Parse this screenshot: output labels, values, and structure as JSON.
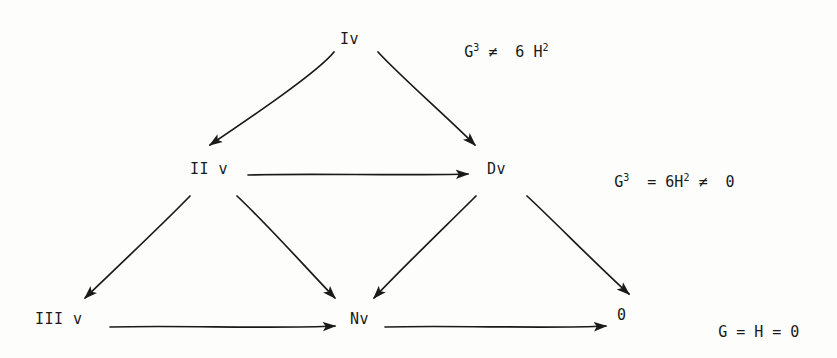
{
  "document": {
    "type": "scanned-mathematical-diagram",
    "background_color": "#fdfdfc",
    "ink_color": "#1a1a1a"
  },
  "nodes": [
    {
      "id": "node-top",
      "label": "Iv",
      "x": 340,
      "y": 32
    },
    {
      "id": "node-middle-left",
      "label": "II v",
      "x": 190,
      "y": 162
    },
    {
      "id": "node-middle-right",
      "label": "Dv",
      "x": 487,
      "y": 162
    },
    {
      "id": "node-bottom-left",
      "label": "III v",
      "x": 35,
      "y": 312
    },
    {
      "id": "node-bottom-mid",
      "label": "Nv",
      "x": 350,
      "y": 312
    },
    {
      "id": "node-bottom-right",
      "label": "0",
      "x": 617,
      "y": 308
    }
  ],
  "equations": [
    {
      "id": "equation-top",
      "x": 428,
      "y": 30,
      "parts": [
        {
          "text": "G",
          "sup": "3"
        },
        {
          "text": " ≠  6 "
        },
        {
          "text": "H",
          "sup": "2"
        }
      ],
      "plain": "G3 ≠ 6 H2"
    },
    {
      "id": "equation-middle",
      "x": 578,
      "y": 160,
      "parts": [
        {
          "text": "G",
          "sup": "3"
        },
        {
          "text": "  = 6"
        },
        {
          "text": "H",
          "sup": "2"
        },
        {
          "text": " ≠  0"
        }
      ],
      "plain": "G3 = 6H2 ≠ 0"
    },
    {
      "id": "equation-bottom",
      "x": 682,
      "y": 310,
      "parts": [
        {
          "text": "G = H = 0"
        }
      ],
      "plain": "G = H = 0"
    }
  ],
  "arrows": [
    {
      "id": "arrow-top-to-middle-left",
      "from": "node-top",
      "to": "node-middle-left",
      "direction": "down-left",
      "x1": 334,
      "y1": 52,
      "x2": 208,
      "y2": 147
    },
    {
      "id": "arrow-top-to-middle-right",
      "from": "node-top",
      "to": "node-middle-right",
      "direction": "down-right",
      "x1": 378,
      "y1": 52,
      "x2": 477,
      "y2": 147
    },
    {
      "id": "arrow-middle-left-to-right",
      "from": "node-middle-left",
      "to": "node-middle-right",
      "direction": "right",
      "x1": 248,
      "y1": 174,
      "x2": 470,
      "y2": 174
    },
    {
      "id": "arrow-middle-left-to-bottom-left",
      "from": "node-middle-left",
      "to": "node-bottom-left",
      "direction": "down-left",
      "x1": 190,
      "y1": 196,
      "x2": 83,
      "y2": 300
    },
    {
      "id": "arrow-middle-left-to-bottom-mid",
      "from": "node-middle-left",
      "to": "node-bottom-mid",
      "direction": "down-right",
      "x1": 237,
      "y1": 196,
      "x2": 333,
      "y2": 300
    },
    {
      "id": "arrow-middle-right-to-bottom-mid",
      "from": "node-middle-right",
      "to": "node-bottom-mid",
      "direction": "down-left",
      "x1": 476,
      "y1": 196,
      "x2": 372,
      "y2": 300
    },
    {
      "id": "arrow-middle-right-to-bottom-right",
      "from": "node-middle-right",
      "to": "node-bottom-right",
      "direction": "down-right",
      "x1": 527,
      "y1": 196,
      "x2": 627,
      "y2": 296
    },
    {
      "id": "arrow-bottom-left-to-mid",
      "from": "node-bottom-left",
      "to": "node-bottom-mid",
      "direction": "right",
      "x1": 110,
      "y1": 326,
      "x2": 337,
      "y2": 326
    },
    {
      "id": "arrow-bottom-mid-to-right",
      "from": "node-bottom-mid",
      "to": "node-bottom-right",
      "direction": "right",
      "x1": 385,
      "y1": 326,
      "x2": 608,
      "y2": 326
    }
  ]
}
